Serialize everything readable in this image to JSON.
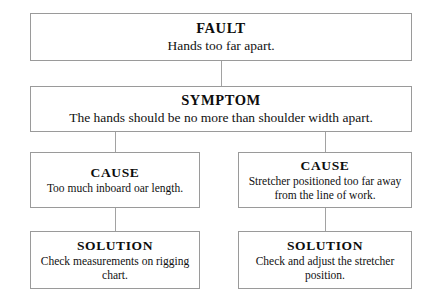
{
  "diagram": {
    "type": "flowchart",
    "orientation": "top-down",
    "colors": {
      "background": "#ffffff",
      "box_border": "#9a9a9a",
      "connector": "#a2a2a2",
      "text": "#111111"
    },
    "nodes": [
      {
        "id": "fault",
        "title": "FAULT",
        "body": "Hands too far apart."
      },
      {
        "id": "symptom",
        "title": "SYMPTOM",
        "body": "The hands should be no more than shoulder width apart."
      },
      {
        "id": "cause_left",
        "title": "CAUSE",
        "body": "Too much inboard oar length."
      },
      {
        "id": "cause_right",
        "title": "CAUSE",
        "body": "Stretcher positioned too far away from the line of work."
      },
      {
        "id": "solution_left",
        "title": "SOLUTION",
        "body": "Check measurements on rigging chart."
      },
      {
        "id": "solution_right",
        "title": "SOLUTION",
        "body": "Check and adjust the stretcher position."
      }
    ],
    "edges": [
      {
        "id": "fault_to_symptom",
        "from": "fault",
        "to": "symptom"
      },
      {
        "id": "symptom_to_cause_l",
        "from": "symptom",
        "to": "cause_left"
      },
      {
        "id": "symptom_to_cause_r",
        "from": "symptom",
        "to": "cause_right"
      },
      {
        "id": "cause_l_to_sol_l",
        "from": "cause_left",
        "to": "solution_left"
      },
      {
        "id": "cause_r_to_sol_r",
        "from": "cause_right",
        "to": "solution_right"
      }
    ]
  }
}
